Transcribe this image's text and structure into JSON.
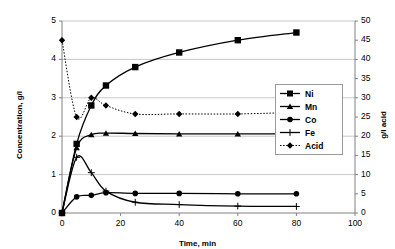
{
  "chart_data": {
    "type": "line",
    "title": "",
    "xlabel": "Time, min",
    "ylabel": "Concentration, g/l",
    "y2label": "g/l acid",
    "xlim": [
      0,
      100
    ],
    "ylim": [
      0,
      5
    ],
    "y2lim": [
      0,
      50
    ],
    "xticks": [
      0,
      20,
      40,
      60,
      80,
      100
    ],
    "yticks": [
      0,
      1,
      2,
      3,
      4,
      5
    ],
    "y2ticks": [
      0,
      5,
      10,
      15,
      20,
      25,
      30,
      35,
      40,
      45,
      50
    ],
    "grid": "horizontal",
    "legend_position": "right-middle",
    "x": [
      0,
      5,
      10,
      15,
      25,
      40,
      60,
      80
    ],
    "series": [
      {
        "name": "Ni",
        "axis": "left",
        "marker": "square",
        "line": "solid",
        "color": "#000000",
        "values": [
          0,
          1.8,
          2.8,
          3.32,
          3.8,
          4.18,
          4.5,
          4.7
        ]
      },
      {
        "name": "Mn",
        "axis": "left",
        "marker": "triangle",
        "line": "solid",
        "color": "#000000",
        "values": [
          0,
          1.7,
          2.04,
          2.08,
          2.07,
          2.06,
          2.06,
          2.06
        ]
      },
      {
        "name": "Co",
        "axis": "left",
        "marker": "circle",
        "line": "solid",
        "color": "#000000",
        "values": [
          0,
          0.42,
          0.46,
          0.53,
          0.51,
          0.51,
          0.5,
          0.5
        ]
      },
      {
        "name": "Fe",
        "axis": "left",
        "marker": "plus",
        "line": "solid",
        "color": "#000000",
        "values": [
          0,
          1.45,
          1.05,
          0.57,
          0.28,
          0.22,
          0.18,
          0.17
        ]
      },
      {
        "name": "Acid",
        "axis": "right",
        "marker": "diamond",
        "line": "dotted",
        "color": "#000000",
        "values": [
          45,
          25,
          30,
          28,
          25.8,
          25.8,
          25.8,
          26.2
        ]
      }
    ],
    "legend": [
      "Ni",
      "Mn",
      "Co",
      "Fe",
      "Acid"
    ]
  },
  "axes": {
    "left_title": "Concentration, g/l",
    "right_title": "g/l acid",
    "bottom_title": "Time, min",
    "left_ticks": [
      "5",
      "4",
      "3",
      "2",
      "1",
      "0"
    ],
    "right_ticks": [
      "50",
      "45",
      "40",
      "35",
      "30",
      "25",
      "20",
      "15",
      "10",
      "5",
      "0"
    ],
    "bottom_ticks": [
      "0",
      "20",
      "40",
      "60",
      "80",
      "100"
    ]
  },
  "legend": {
    "items": [
      {
        "label": "Ni"
      },
      {
        "label": "Mn"
      },
      {
        "label": "Co"
      },
      {
        "label": "Fe"
      },
      {
        "label": "Acid"
      }
    ]
  }
}
